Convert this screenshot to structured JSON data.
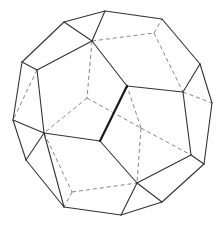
{
  "figure": {
    "colors": {
      "solid": "#333333",
      "thick": "#1a1a1a",
      "hidden": "#777777",
      "background": "#ffffff"
    },
    "vertices": {
      "A": [
        64,
        22
      ],
      "B": [
        105,
        11
      ],
      "C": [
        162,
        19
      ],
      "D": [
        92,
        41
      ],
      "U": [
        154,
        33
      ],
      "E": [
        22,
        62
      ],
      "F": [
        37,
        70
      ],
      "G": [
        13,
        120
      ],
      "H": [
        44,
        133
      ],
      "I": [
        200,
        64
      ],
      "J": [
        183,
        92
      ],
      "K": [
        212,
        103
      ],
      "L": [
        191,
        155
      ],
      "M": [
        204,
        164
      ],
      "N": [
        26,
        160
      ],
      "O": [
        64,
        207
      ],
      "P": [
        121,
        215
      ],
      "Q": [
        162,
        202
      ],
      "R": [
        137,
        183
      ],
      "S": [
        127,
        86
      ],
      "T": [
        100,
        141
      ],
      "V": [
        87,
        98
      ],
      "W": [
        141,
        128
      ],
      "X": [
        72,
        192
      ]
    },
    "edges_solid": [
      [
        "A",
        "B"
      ],
      [
        "B",
        "C"
      ],
      [
        "C",
        "I"
      ],
      [
        "I",
        "K"
      ],
      [
        "K",
        "M"
      ],
      [
        "M",
        "Q"
      ],
      [
        "Q",
        "P"
      ],
      [
        "P",
        "O"
      ],
      [
        "O",
        "N"
      ],
      [
        "N",
        "G"
      ],
      [
        "G",
        "E"
      ],
      [
        "E",
        "A"
      ],
      [
        "E",
        "F"
      ],
      [
        "F",
        "D"
      ],
      [
        "A",
        "D"
      ],
      [
        "B",
        "D"
      ],
      [
        "F",
        "H"
      ],
      [
        "G",
        "H"
      ],
      [
        "H",
        "N"
      ],
      [
        "I",
        "J"
      ],
      [
        "J",
        "L"
      ],
      [
        "L",
        "M"
      ],
      [
        "L",
        "R"
      ],
      [
        "R",
        "P"
      ],
      [
        "R",
        "Q"
      ],
      [
        "H",
        "O"
      ],
      [
        "S",
        "J"
      ],
      [
        "T",
        "H"
      ],
      [
        "S",
        "D"
      ],
      [
        "T",
        "R"
      ]
    ],
    "edges_thick": [
      [
        "S",
        "T"
      ]
    ],
    "edges_hidden": [
      [
        "D",
        "U"
      ],
      [
        "U",
        "C"
      ],
      [
        "U",
        "J"
      ],
      [
        "J",
        "K"
      ],
      [
        "D",
        "V"
      ],
      [
        "V",
        "H"
      ],
      [
        "V",
        "W"
      ],
      [
        "W",
        "S"
      ],
      [
        "W",
        "L"
      ],
      [
        "W",
        "R"
      ],
      [
        "H",
        "X"
      ],
      [
        "X",
        "O"
      ],
      [
        "X",
        "R"
      ],
      [
        "F",
        "G"
      ]
    ]
  }
}
